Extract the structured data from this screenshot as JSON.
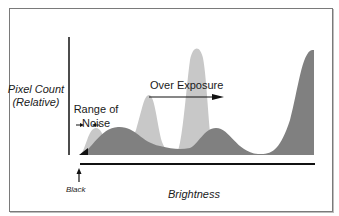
{
  "diagram": {
    "type": "histogram-illustration",
    "y_axis_label_line1": "Pixel Count",
    "y_axis_label_line2": "(Relative)",
    "x_axis_label": "Brightness",
    "black_marker_label": "Black",
    "annotations": {
      "range_of_noise_line1": "Range of",
      "range_of_noise_line2": "Noise",
      "over_exposure": "Over Exposure"
    },
    "series": [
      {
        "name": "over-exposed histogram",
        "color": "#c8c8c8"
      },
      {
        "name": "normal histogram",
        "color": "#808080"
      }
    ],
    "colors": {
      "light_fill": "#c8c8c8",
      "dark_fill": "#808080",
      "axis": "#111111",
      "frame": "#7a7a7a"
    }
  }
}
